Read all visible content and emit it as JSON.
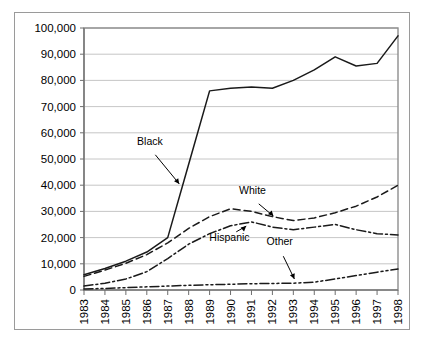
{
  "chart_data": {
    "type": "line",
    "title": "",
    "subtitle": "",
    "xlabel": "",
    "ylabel": "",
    "grid": true,
    "legend_position": "inline-annotations",
    "x": [
      1983,
      1984,
      1985,
      1986,
      1987,
      1988,
      1989,
      1990,
      1991,
      1992,
      1993,
      1994,
      1995,
      1996,
      1997,
      1998
    ],
    "categories": [
      "1983",
      "1984",
      "1985",
      "1986",
      "1987",
      "1988",
      "1989",
      "1990",
      "1991",
      "1992",
      "1993",
      "1994",
      "1995",
      "1996",
      "1997",
      "1998"
    ],
    "xlim": [
      1983,
      1998
    ],
    "ylim": [
      0,
      100000
    ],
    "yticks": [
      0,
      10000,
      20000,
      30000,
      40000,
      50000,
      60000,
      70000,
      80000,
      90000,
      100000
    ],
    "ytick_labels": [
      "0",
      "10,000",
      "20,000",
      "30,000",
      "40,000",
      "50,000",
      "60,000",
      "70,000",
      "80,000",
      "90,000",
      "100,000"
    ],
    "series": [
      {
        "name": "Black",
        "style": "solid",
        "values": [
          5800,
          8200,
          11000,
          14500,
          20000,
          48000,
          76000,
          77000,
          77500,
          77000,
          80000,
          84000,
          89000,
          85500,
          86500,
          97000
        ]
      },
      {
        "name": "White",
        "style": "dashed",
        "values": [
          5200,
          7600,
          10200,
          13500,
          18000,
          23500,
          28000,
          31000,
          30000,
          28000,
          26500,
          27500,
          29500,
          32000,
          35500,
          40000
        ]
      },
      {
        "name": "Hispanic",
        "style": "dash-dot",
        "values": [
          1500,
          2600,
          4200,
          7000,
          12000,
          17500,
          21500,
          24500,
          26000,
          24000,
          23000,
          24000,
          25000,
          23000,
          21500,
          21000
        ]
      },
      {
        "name": "Other",
        "style": "dash-dot-dot",
        "values": [
          400,
          600,
          900,
          1200,
          1500,
          1800,
          2000,
          2200,
          2400,
          2500,
          2600,
          3000,
          4200,
          5500,
          6800,
          8000
        ]
      }
    ],
    "annotations": [
      {
        "label": "Black",
        "text_x": 1986.15,
        "text_y": 55500,
        "point_x": 1987.55,
        "point_y": 40500
      },
      {
        "label": "White",
        "text_x": 1991.05,
        "text_y": 36500,
        "point_x": 1992.05,
        "point_y": 28200
      },
      {
        "label": "Hispanic",
        "text_x": 1989.95,
        "text_y": 18800,
        "point_x": 1990.75,
        "point_y": 24400
      },
      {
        "label": "Other",
        "text_x": 1992.35,
        "text_y": 17200,
        "point_x": 1993.05,
        "point_y": 4200
      }
    ]
  },
  "colors": {
    "background": "#ffffff",
    "line": "#1a1a1a",
    "grid": "#b8b8b8",
    "axis": "#7d7d7d",
    "frame": "#9a9a9a",
    "text": "#000000"
  }
}
